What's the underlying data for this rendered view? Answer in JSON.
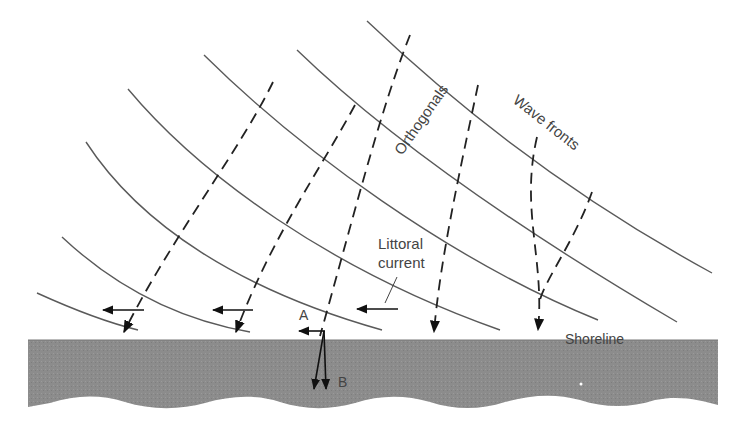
{
  "diagram": {
    "labels": {
      "orthogonals": "Orthogonals",
      "wave_fronts": "Wave fronts",
      "littoral_line1": "Littoral",
      "littoral_line2": "current",
      "shoreline": "Shoreline",
      "point_a": "A",
      "point_b": "B"
    },
    "colors": {
      "land": "#8c8c8c",
      "lines": "#5a5a5a",
      "dashed": "#222222",
      "background": "#ffffff"
    }
  }
}
